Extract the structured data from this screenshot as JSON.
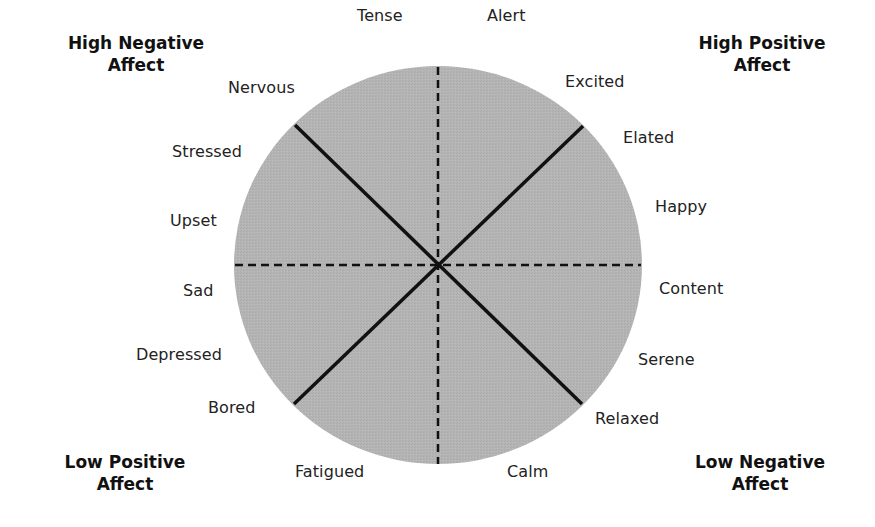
{
  "diagram": {
    "type": "circumplex-affect-wheel",
    "colors": {
      "circle_fill": "#b4b4b4",
      "axis_lines": "#111111",
      "background": "#ffffff"
    },
    "quadrants": {
      "top_left": {
        "line1": "High Negative",
        "line2": "Affect"
      },
      "top_right": {
        "line1": "High Positive",
        "line2": "Affect"
      },
      "bottom_left": {
        "line1": "Low Positive",
        "line2": "Affect"
      },
      "bottom_right": {
        "line1": "Low Negative",
        "line2": "Affect"
      }
    },
    "moods": {
      "tense": "Tense",
      "alert": "Alert",
      "excited": "Excited",
      "elated": "Elated",
      "happy": "Happy",
      "content": "Content",
      "serene": "Serene",
      "relaxed": "Relaxed",
      "calm": "Calm",
      "fatigued": "Fatigued",
      "bored": "Bored",
      "depressed": "Depressed",
      "sad": "Sad",
      "upset": "Upset",
      "stressed": "Stressed",
      "nervous": "Nervous"
    }
  }
}
